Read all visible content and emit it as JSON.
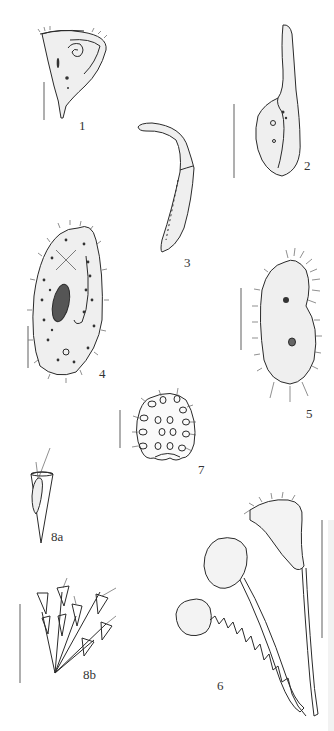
{
  "plate": {
    "background": "#ffffff",
    "ink_color": "#2a2a2a",
    "scale_bar_color": "#7a7a7a"
  },
  "figures": [
    {
      "id": "fig-1",
      "label": "1",
      "description": "trumpet/cone-shaped ciliate with spiral oral region"
    },
    {
      "id": "fig-2",
      "label": "2",
      "description": "elongate ciliate with long neck and oral groove"
    },
    {
      "id": "fig-3",
      "label": "3",
      "description": "long slender curved ciliate"
    },
    {
      "id": "fig-4",
      "label": "4",
      "description": "Paramecium-like oval ciliate with macronucleus"
    },
    {
      "id": "fig-5",
      "label": "5",
      "description": "hypotrich ciliate with cirri"
    },
    {
      "id": "fig-6",
      "label": "6",
      "description": "stalked peritrich ciliates, one with coiled stalk"
    },
    {
      "id": "fig-7",
      "label": "7",
      "description": "barrel-shaped colonial form with cells"
    },
    {
      "id": "fig-8a",
      "label": "8a",
      "description": "single loricate cell in conical lorica"
    },
    {
      "id": "fig-8b",
      "label": "8b",
      "description": "branched colony of loricate cells"
    }
  ]
}
